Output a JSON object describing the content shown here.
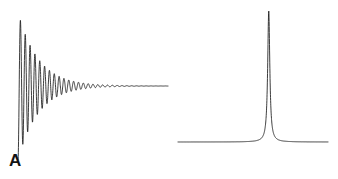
{
  "figure": {
    "background_color": "#ffffff",
    "trace_color": "#1a1a1a",
    "label_color": "#121212",
    "width": 338,
    "height": 179
  },
  "panels": [
    {
      "id": "A",
      "label": "A",
      "name": "free-induction-decay",
      "description": "Exponentially damped sinusoid (time-domain signal)",
      "axes_visible": false,
      "grid": false
    },
    {
      "id": "B",
      "label": "B",
      "name": "lorentzian-spectrum",
      "description": "Single sharp Lorentzian resonance line (frequency-domain spectrum)",
      "axes_visible": false,
      "grid": false
    }
  ],
  "chart_data": [
    {
      "type": "line",
      "panel": "A",
      "title": "",
      "subtitle": "",
      "xlabel": "",
      "ylabel": "",
      "annotations": [
        "A"
      ],
      "legend": [],
      "legend_position": "none",
      "grid": false,
      "axis_visible": false,
      "xlim": [
        0,
        1
      ],
      "ylim": [
        -1.05,
        1.05
      ],
      "baseline": 0,
      "model": "damped_sinusoid",
      "equation": "y(t) = exp(-t / tau) * cos(2 * pi * f * t)",
      "params": {
        "amplitude": 1.0,
        "tau": 0.135,
        "frequency_cycles_over_range": 31.0,
        "phase_deg": 180.0,
        "n_samples": 1400
      },
      "x_start_fraction": 0.0,
      "x_end_fraction": 1.0,
      "peak_envelope_points": [
        {
          "x": 0.0,
          "envelope": 1.0
        },
        {
          "x": 0.05,
          "envelope": 0.69
        },
        {
          "x": 0.1,
          "envelope": 0.48
        },
        {
          "x": 0.15,
          "envelope": 0.33
        },
        {
          "x": 0.2,
          "envelope": 0.23
        },
        {
          "x": 0.3,
          "envelope": 0.11
        },
        {
          "x": 0.4,
          "envelope": 0.052
        },
        {
          "x": 0.5,
          "envelope": 0.025
        },
        {
          "x": 0.6,
          "envelope": 0.012
        },
        {
          "x": 0.8,
          "envelope": 0.003
        },
        {
          "x": 1.0,
          "envelope": 0.0006
        }
      ]
    },
    {
      "type": "line",
      "panel": "B",
      "title": "",
      "subtitle": "",
      "xlabel": "",
      "ylabel": "",
      "annotations": [
        "B"
      ],
      "legend": [],
      "legend_position": "none",
      "grid": false,
      "axis_visible": false,
      "xlim": [
        0,
        1
      ],
      "ylim": [
        0,
        1.05
      ],
      "baseline": 0,
      "model": "lorentzian",
      "equation": "y(f) = A / (1 + ((f - f0) / hwhm)^2)",
      "params": {
        "amplitude": 1.0,
        "center": 0.605,
        "hwhm": 0.0085,
        "n_samples": 1600
      },
      "peak": {
        "x": 0.605,
        "y": 1.0
      },
      "profile_points": [
        {
          "x": 0.0,
          "y": 0.0002
        },
        {
          "x": 0.2,
          "y": 0.0005
        },
        {
          "x": 0.4,
          "y": 0.0017
        },
        {
          "x": 0.5,
          "y": 0.0062
        },
        {
          "x": 0.55,
          "y": 0.0276
        },
        {
          "x": 0.58,
          "y": 0.114
        },
        {
          "x": 0.595,
          "y": 0.419
        },
        {
          "x": 0.605,
          "y": 1.0
        },
        {
          "x": 0.615,
          "y": 0.419
        },
        {
          "x": 0.63,
          "y": 0.114
        },
        {
          "x": 0.66,
          "y": 0.0276
        },
        {
          "x": 0.72,
          "y": 0.0053
        },
        {
          "x": 0.85,
          "y": 0.0012
        },
        {
          "x": 1.0,
          "y": 0.0006
        }
      ]
    }
  ]
}
